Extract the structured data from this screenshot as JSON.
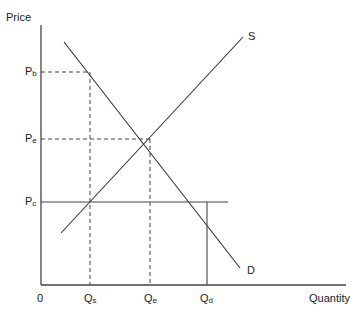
{
  "diagram": {
    "axes": {
      "y_label": "Price",
      "x_label": "Quantity",
      "origin_label": "0"
    },
    "curves": {
      "supply_label": "S",
      "demand_label": "D"
    },
    "price_levels": [
      {
        "main": "P",
        "sub": "b"
      },
      {
        "main": "P",
        "sub": "e"
      },
      {
        "main": "P",
        "sub": "c"
      }
    ],
    "quantity_levels": [
      {
        "main": "Q",
        "sub": "s"
      },
      {
        "main": "Q",
        "sub": "e"
      },
      {
        "main": "Q",
        "sub": "d"
      }
    ],
    "colors": {
      "line": "#333333",
      "dashed": "#444444",
      "text": "#222222"
    }
  }
}
